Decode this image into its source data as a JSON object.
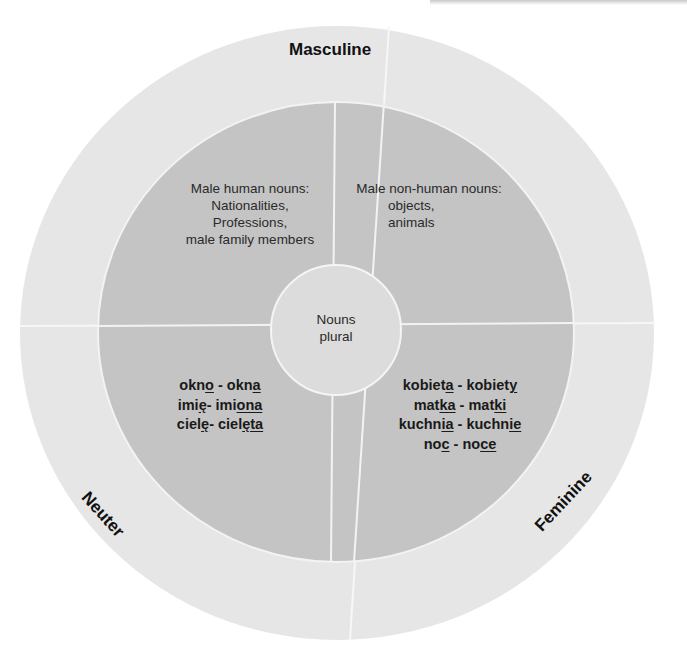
{
  "diagram": {
    "colors": {
      "outer_ring": "#e6e6e6",
      "inner_disk": "#c4c4c4",
      "center_circle": "#dcdcdc",
      "divider": "#f7f7f7",
      "text": "#1a1a1a"
    },
    "center": {
      "line1": "Nouns",
      "line2": "plural"
    },
    "genders": {
      "masculine": "Masculine",
      "neuter": "Neuter",
      "feminine": "Feminine"
    },
    "quadrants": {
      "top_left": {
        "line1": "Male human nouns:",
        "line2": "Nationalities,",
        "line3": "Professions,",
        "line4": "male family members"
      },
      "top_right": {
        "line1": "Male non-human nouns:",
        "line2": "objects,",
        "line3": "animals"
      },
      "bottom_left": {
        "rows": [
          {
            "sg_stem": "okn",
            "sg_end": "o",
            "sep": " - ",
            "pl_stem": "okn",
            "pl_end": "a"
          },
          {
            "sg_stem": "imi",
            "sg_end": "ę",
            "sep": "- ",
            "pl_stem": "imi",
            "pl_end": "ona"
          },
          {
            "sg_stem": "ciel",
            "sg_end": "ę",
            "sep": "- ",
            "pl_stem": "ciel",
            "pl_end": "ęta"
          }
        ]
      },
      "bottom_right": {
        "rows": [
          {
            "sg_stem": "kobiet",
            "sg_end": "a",
            "sep": " - ",
            "pl_stem": "kobiet",
            "pl_end": "y"
          },
          {
            "sg_stem": "mat",
            "sg_end": "ka",
            "sep": " - ",
            "pl_stem": "mat",
            "pl_end": "ki"
          },
          {
            "sg_stem": "kuchn",
            "sg_end": "ia",
            "sep": " - ",
            "pl_stem": "kuchn",
            "pl_end": "ie"
          },
          {
            "sg_stem": "no",
            "sg_end": "c",
            "sep": " - ",
            "pl_stem": "no",
            "pl_end": "ce"
          }
        ]
      }
    }
  }
}
